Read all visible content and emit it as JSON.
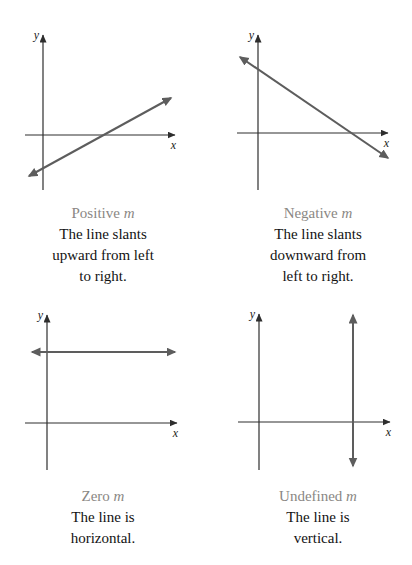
{
  "figure": {
    "colors": {
      "background": "#ffffff",
      "axis-color": "#2e2e2e",
      "slope-line-color": "#5d5d5d",
      "caption-title-color": "#8a8784",
      "caption-text-color": "#121212"
    },
    "panels": [
      {
        "slope": "positive",
        "y_label": "y",
        "x_label": "x",
        "caption_title": "Positive",
        "caption_var": "m",
        "caption_lines": [
          "The line slants",
          "upward from left",
          "to right."
        ]
      },
      {
        "slope": "negative",
        "y_label": "y",
        "x_label": "x",
        "caption_title": "Negative",
        "caption_var": "m",
        "caption_lines": [
          "The line slants",
          "downward from",
          "left to right."
        ]
      },
      {
        "slope": "zero",
        "y_label": "y",
        "x_label": "x",
        "caption_title": "Zero",
        "caption_var": "m",
        "caption_lines": [
          "The line is",
          "horizontal."
        ]
      },
      {
        "slope": "undefined",
        "y_label": "y",
        "x_label": "x",
        "caption_title": "Undefined",
        "caption_var": "m",
        "caption_lines": [
          "The line is",
          "vertical."
        ]
      }
    ]
  }
}
